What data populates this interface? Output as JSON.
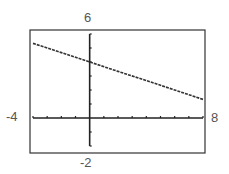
{
  "window": {
    "xmin": "-4",
    "xmax": "8",
    "ymin": "-2",
    "ymax": "6"
  },
  "chart_data": {
    "type": "line",
    "title": "",
    "xlabel": "",
    "ylabel": "",
    "xlim": [
      -4,
      8
    ],
    "ylim": [
      -2,
      6
    ],
    "xscale": 1,
    "yscale": 1,
    "grid": false,
    "legend": null,
    "tick_labels": {
      "x_min": "-4",
      "x_max": "8",
      "y_min": "-2",
      "y_max": "6"
    },
    "series": [
      {
        "name": "y = 4 - x/3",
        "x": [
          -4,
          -2,
          0,
          2,
          4,
          6,
          8
        ],
        "y": [
          5.33,
          4.67,
          4,
          3.33,
          2.67,
          2,
          1.33
        ]
      }
    ]
  },
  "colors": {
    "axis": "#222222",
    "line": "#333333",
    "frame": "#333333",
    "label": "#555555"
  }
}
